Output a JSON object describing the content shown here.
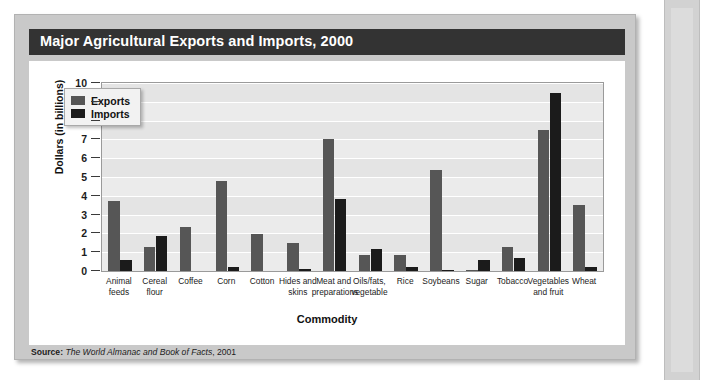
{
  "figure": {
    "title": "Major Agricultural Exports and Imports, 2000",
    "source_label": "Source:",
    "source_work": "The World Almanac and Book of Facts",
    "source_year": ", 2001"
  },
  "colors": {
    "exports": "#565656",
    "imports": "#1b1b1b",
    "title_bar": "#333333",
    "panel": "#c9c9c9",
    "plot_background": "#e4e4e4",
    "plot_band": "#ebebeb",
    "gridline": "#ffffff"
  },
  "legend": {
    "position": "inside-top-left",
    "entries": [
      {
        "label": "Exports",
        "color": "#565656"
      },
      {
        "label": "Imports",
        "color": "#1b1b1b"
      }
    ]
  },
  "chart_data": {
    "type": "bar",
    "title": "Major Agricultural Exports and Imports, 2000",
    "xlabel": "Commodity",
    "ylabel": "Dollars (in billions)",
    "ylim": [
      0,
      10
    ],
    "yticks": [
      0,
      1,
      2,
      3,
      4,
      5,
      6,
      7,
      8,
      9,
      10
    ],
    "ytick_labels": [
      "0",
      "1",
      "2",
      "3",
      "4",
      "5",
      "6",
      "7",
      "8",
      "9",
      "10"
    ],
    "grid": true,
    "legend_position": "upper left",
    "categories": [
      "Animal feeds",
      "Cereal flour",
      "Coffee",
      "Corn",
      "Cotton",
      "Hides and skins",
      "Meat and preparations",
      "Oils/fats, vegetable",
      "Rice",
      "Soybeans",
      "Sugar",
      "Tobacco",
      "Vegetables and fruit",
      "Wheat"
    ],
    "category_lines": [
      [
        "Animal",
        "feeds"
      ],
      [
        "Cereal",
        "flour"
      ],
      [
        "Coffee"
      ],
      [
        "Corn"
      ],
      [
        "Cotton"
      ],
      [
        "Hides and",
        "skins"
      ],
      [
        "Meat and",
        "preparations"
      ],
      [
        "Oils/fats,",
        "vegetable"
      ],
      [
        "Rice"
      ],
      [
        "Soybeans"
      ],
      [
        "Sugar"
      ],
      [
        "Tobacco"
      ],
      [
        "Vegetables",
        "and fruit"
      ],
      [
        "Wheat"
      ]
    ],
    "series": [
      {
        "name": "Exports",
        "color": "#565656",
        "values": [
          3.75,
          1.3,
          2.35,
          4.8,
          1.95,
          1.5,
          7.0,
          0.85,
          0.85,
          5.35,
          0.05,
          1.3,
          7.5,
          3.5
        ]
      },
      {
        "name": "Imports",
        "color": "#1b1b1b",
        "values": [
          0.6,
          1.85,
          0.0,
          0.2,
          0.0,
          0.1,
          3.85,
          1.15,
          0.2,
          0.08,
          0.6,
          0.7,
          9.45,
          0.2
        ]
      }
    ]
  }
}
